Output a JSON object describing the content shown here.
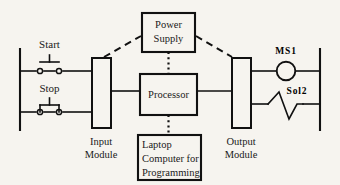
{
  "diagram": {
    "background_color": "#f6f4ef",
    "line_color": "#111111",
    "labels": {
      "start": "Start",
      "stop": "Stop",
      "input_module_line1": "Input",
      "input_module_line2": "Module",
      "power_supply_line1": "Power",
      "power_supply_line2": "Supply",
      "processor": "Processor",
      "laptop_line1": "Laptop",
      "laptop_line2": "Computer for",
      "laptop_line3": "Programming",
      "output_module_line1": "Output",
      "output_module_line2": "Module",
      "motor_starter": "MS1",
      "solenoid": "Sol2"
    },
    "nodes": [
      {
        "id": "start-pushbutton",
        "label": "Start",
        "type": "normally-open-pushbutton"
      },
      {
        "id": "stop-pushbutton",
        "label": "Stop",
        "type": "normally-closed-pushbutton"
      },
      {
        "id": "input-module",
        "label": "Input Module",
        "type": "module"
      },
      {
        "id": "power-supply",
        "label": "Power Supply",
        "type": "box"
      },
      {
        "id": "processor",
        "label": "Processor",
        "type": "box"
      },
      {
        "id": "laptop",
        "label": "Laptop Computer for Programming",
        "type": "box"
      },
      {
        "id": "output-module",
        "label": "Output Module",
        "type": "module"
      },
      {
        "id": "motor-starter-coil",
        "label": "MS1",
        "type": "coil"
      },
      {
        "id": "solenoid",
        "label": "Sol2",
        "type": "solenoid"
      }
    ],
    "connections": [
      {
        "from": "input-module",
        "to": "power-supply",
        "style": "dashed"
      },
      {
        "from": "power-supply",
        "to": "output-module",
        "style": "dashed"
      },
      {
        "from": "power-supply",
        "to": "processor",
        "style": "dotted"
      },
      {
        "from": "processor",
        "to": "laptop",
        "style": "dotted"
      },
      {
        "from": "input-module",
        "to": "processor",
        "style": "solid"
      },
      {
        "from": "processor",
        "to": "output-module",
        "style": "solid"
      },
      {
        "from": "start-pushbutton",
        "to": "input-module",
        "style": "solid"
      },
      {
        "from": "stop-pushbutton",
        "to": "input-module",
        "style": "solid"
      },
      {
        "from": "output-module",
        "to": "motor-starter-coil",
        "style": "solid"
      },
      {
        "from": "output-module",
        "to": "solenoid",
        "style": "solid"
      }
    ]
  }
}
